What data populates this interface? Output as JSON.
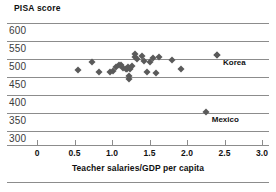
{
  "chart_data": {
    "type": "scatter",
    "title": "",
    "ylabel": "PISA score",
    "xlabel": "Teacher salaries/GDP per capita",
    "xlim": [
      0,
      3.0
    ],
    "ylim": [
      300,
      600
    ],
    "grid": true,
    "legend": "none",
    "xticks": [
      "0",
      "0.5",
      "1.0",
      "1.5",
      "2.0",
      "2.5",
      "3.0"
    ],
    "xtick_values": [
      0,
      0.5,
      1.0,
      1.5,
      2.0,
      2.5,
      3.0
    ],
    "yticks": [
      "600",
      "550",
      "500",
      "450",
      "400",
      "350",
      "300"
    ],
    "ytick_values": [
      600,
      550,
      500,
      450,
      400,
      350,
      300
    ],
    "points": [
      {
        "x": 0.55,
        "y": 470
      },
      {
        "x": 0.73,
        "y": 491
      },
      {
        "x": 0.82,
        "y": 464
      },
      {
        "x": 0.97,
        "y": 465
      },
      {
        "x": 1.01,
        "y": 466
      },
      {
        "x": 1.05,
        "y": 479
      },
      {
        "x": 1.09,
        "y": 482
      },
      {
        "x": 1.12,
        "y": 484
      },
      {
        "x": 1.15,
        "y": 474
      },
      {
        "x": 1.18,
        "y": 473
      },
      {
        "x": 1.2,
        "y": 472
      },
      {
        "x": 1.21,
        "y": 477
      },
      {
        "x": 1.22,
        "y": 452
      },
      {
        "x": 1.22,
        "y": 444
      },
      {
        "x": 1.24,
        "y": 473
      },
      {
        "x": 1.27,
        "y": 480
      },
      {
        "x": 1.3,
        "y": 515
      },
      {
        "x": 1.31,
        "y": 506
      },
      {
        "x": 1.33,
        "y": 499
      },
      {
        "x": 1.4,
        "y": 508
      },
      {
        "x": 1.42,
        "y": 495
      },
      {
        "x": 1.46,
        "y": 465
      },
      {
        "x": 1.5,
        "y": 493
      },
      {
        "x": 1.55,
        "y": 503
      },
      {
        "x": 1.58,
        "y": 461
      },
      {
        "x": 1.62,
        "y": 505
      },
      {
        "x": 1.8,
        "y": 498
      },
      {
        "x": 1.92,
        "y": 473
      },
      {
        "x": 2.4,
        "y": 512
      }
    ],
    "annotations": [
      {
        "label": "Korea",
        "x": 2.4,
        "y": 512,
        "marker": true
      },
      {
        "label": "Mexico",
        "x": 2.25,
        "y": 352,
        "marker": true
      }
    ]
  }
}
